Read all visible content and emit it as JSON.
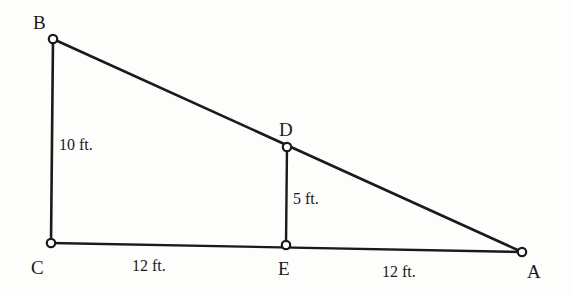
{
  "figure": {
    "type": "geometry-diagram",
    "background_color": "#fdfdfc",
    "stroke_color": "#1a1a1a",
    "vertex_fill_color": "#ffffff",
    "vertices": [
      {
        "id": "B",
        "label": "B",
        "x": 53,
        "y": 39
      },
      {
        "id": "C",
        "label": "C",
        "x": 51,
        "y": 243
      },
      {
        "id": "D",
        "label": "D",
        "x": 287,
        "y": 147
      },
      {
        "id": "E",
        "label": "E",
        "x": 286,
        "y": 245
      },
      {
        "id": "A",
        "label": "A",
        "x": 522,
        "y": 252
      }
    ],
    "segments": [
      {
        "id": "BC",
        "from": "B",
        "to": "C"
      },
      {
        "id": "BA",
        "from": "B",
        "to": "A"
      },
      {
        "id": "CA",
        "from": "C",
        "to": "A"
      },
      {
        "id": "DE",
        "from": "D",
        "to": "E"
      }
    ],
    "measurements": [
      {
        "id": "bc",
        "segment": "BC",
        "text": "10 ft.",
        "value": 10,
        "unit": "ft."
      },
      {
        "id": "de",
        "segment": "DE",
        "text": "5 ft.",
        "value": 5,
        "unit": "ft."
      },
      {
        "id": "ce",
        "segment": "CE",
        "text": "12 ft.",
        "value": 12,
        "unit": "ft."
      },
      {
        "id": "ea",
        "segment": "EA",
        "text": "12 ft.",
        "value": 12,
        "unit": "ft."
      }
    ]
  }
}
